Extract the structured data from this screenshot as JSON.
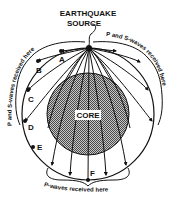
{
  "diagram": {
    "title_line1": "EARTHQUAKE",
    "title_line2": "SOURCE",
    "core_label": "CORE",
    "points": {
      "A": "A",
      "B": "B",
      "C": "C",
      "D": "D",
      "E": "E",
      "F": "F"
    },
    "left_bracket_label": "P and S-waves received here",
    "right_bracket_label": "P and S-waves received here",
    "bottom_bracket_label": "P-waves received here",
    "colors": {
      "ink": "#111111",
      "core_fill": "#9a9a9a",
      "background": "#ffffff"
    }
  }
}
